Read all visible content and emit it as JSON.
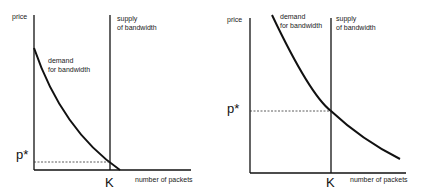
{
  "diagrams": [
    {
      "id": "left",
      "y_axis_label": "price",
      "x_axis_label": "number of packets",
      "price_marker": "p*",
      "capacity_marker": "K",
      "demand_label": [
        "demand",
        "for bandwidth"
      ],
      "supply_label": [
        "supply",
        "of bandwidth"
      ],
      "description": "Demand intersects fixed supply K at a low price p*"
    },
    {
      "id": "right",
      "y_axis_label": "price",
      "x_axis_label": "number of packets",
      "price_marker": "p*",
      "capacity_marker": "K",
      "demand_label": [
        "demand",
        "for bandwidth"
      ],
      "supply_label": [
        "supply",
        "of bandwidth"
      ],
      "description": "Higher demand intersects fixed supply K at a higher price p*"
    }
  ],
  "colors": {
    "line": "#111111",
    "text": "#222222",
    "background": "#ffffff"
  }
}
